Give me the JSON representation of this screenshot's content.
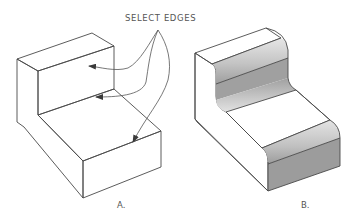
{
  "figure": {
    "callout_text": "SELECT EDGES",
    "panels": [
      {
        "id": "A",
        "label": "A.",
        "description": "Stepped L-shaped block with sharp edges; three edges selected via leader arrows"
      },
      {
        "id": "B",
        "label": "B.",
        "description": "Same stepped block after fillet applied to selected edges (rounded edges)"
      }
    ],
    "colors": {
      "background": "#ffffff",
      "top_face": "#e2e2e2",
      "side_face": "#d4d4d4",
      "front_face": "#9c9c9c",
      "edge": "#4a4a4a",
      "leader": "#555555"
    },
    "leaders": {
      "origin": [
        158,
        30
      ],
      "count": 3
    }
  }
}
